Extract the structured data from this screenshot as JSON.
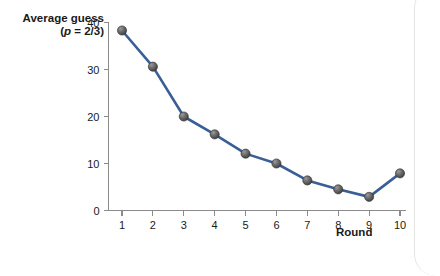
{
  "chart_data": {
    "type": "line",
    "title": "",
    "subtitle": "",
    "xlabel": "Round",
    "ylabel_main": "Average guess",
    "ylabel_sub_open": "(",
    "ylabel_sub_p": "p",
    "ylabel_sub_rest": " = 2/3)",
    "x": [
      1,
      2,
      3,
      4,
      5,
      6,
      7,
      8,
      9,
      10
    ],
    "categories": [
      "1",
      "2",
      "3",
      "4",
      "5",
      "6",
      "7",
      "8",
      "9",
      "10"
    ],
    "values": [
      38.3,
      30.6,
      20.0,
      16.2,
      12.1,
      10.0,
      6.4,
      4.5,
      2.9,
      7.9
    ],
    "series": [
      {
        "name": "Average guess",
        "values": [
          38.3,
          30.6,
          20.0,
          16.2,
          12.1,
          10.0,
          6.4,
          4.5,
          2.9,
          7.9
        ]
      }
    ],
    "xlim": [
      0.55,
      10.45
    ],
    "ylim": [
      0,
      40
    ],
    "yticks": [
      0,
      10,
      20,
      30,
      40
    ],
    "ytick_labels": [
      "0",
      "10",
      "20",
      "30",
      "40"
    ],
    "xticks": [
      1,
      2,
      3,
      4,
      5,
      6,
      7,
      8,
      9,
      10
    ],
    "xtick_labels": [
      "1",
      "2",
      "3",
      "4",
      "5",
      "6",
      "7",
      "8",
      "9",
      "10"
    ],
    "grid": false,
    "legend": false,
    "legend_position": "none",
    "line_color": "#3a5f96",
    "marker_color": "#5f5f5f",
    "marker_shape": "sphere",
    "axis_color": "#8b8b8b",
    "background_color": "#ffffff"
  }
}
